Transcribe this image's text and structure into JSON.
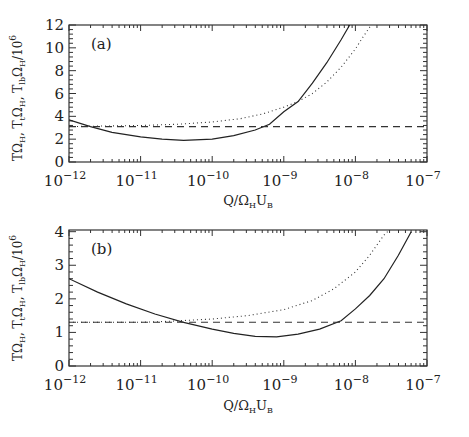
{
  "chart_data": [
    {
      "type": "line",
      "panel_label": "(a)",
      "xscale": "log",
      "xlim_log10": [
        -12,
        -7
      ],
      "ylim": [
        0,
        12
      ],
      "x_tick_labels": [
        {
          "base": "10",
          "exp": "−12"
        },
        {
          "base": "10",
          "exp": "−11"
        },
        {
          "base": "10",
          "exp": "−10"
        },
        {
          "base": "10",
          "exp": "−9"
        },
        {
          "base": "10",
          "exp": "−8"
        },
        {
          "base": "10",
          "exp": "−7"
        }
      ],
      "y_tick_labels": [
        "0",
        "2",
        "4",
        "6",
        "8",
        "10",
        "12"
      ],
      "y_ticks": [
        0,
        2,
        4,
        6,
        8,
        10,
        12
      ],
      "xlabel": {
        "main": "Q/Ω",
        "sub1": "H",
        "mid": "U",
        "sub2": "B"
      },
      "ylabel": "TΩH, TtΩH, TlbΩH/10^6",
      "series": [
        {
          "name": "T Ω_H",
          "style": "solid",
          "log10_x": [
            -12,
            -11.7,
            -11.4,
            -11.0,
            -10.7,
            -10.4,
            -10.0,
            -9.7,
            -9.4,
            -9.2,
            -9.0,
            -8.8,
            -8.6,
            -8.4,
            -8.2,
            -8.08
          ],
          "y": [
            3.7,
            3.1,
            2.6,
            2.2,
            2.0,
            1.9,
            2.0,
            2.3,
            2.8,
            3.3,
            4.4,
            5.3,
            6.9,
            8.7,
            10.7,
            12.0
          ]
        },
        {
          "name": "T_t Ω_H",
          "style": "dotted",
          "log10_x": [
            -12,
            -11.5,
            -11.0,
            -10.5,
            -10.0,
            -9.6,
            -9.3,
            -9.0,
            -8.8,
            -8.6,
            -8.4,
            -8.2,
            -8.0,
            -7.9,
            -7.78
          ],
          "y": [
            3.1,
            3.15,
            3.2,
            3.3,
            3.5,
            3.8,
            4.2,
            4.8,
            5.3,
            6.0,
            7.0,
            8.3,
            9.9,
            10.9,
            12.0
          ]
        },
        {
          "name": "T_lb Ω_H",
          "style": "dashed",
          "log10_x": [
            -12,
            -7
          ],
          "y": [
            3.1,
            3.1
          ]
        }
      ]
    },
    {
      "type": "line",
      "panel_label": "(b)",
      "xscale": "log",
      "xlim_log10": [
        -12,
        -7
      ],
      "ylim": [
        0,
        4.05
      ],
      "x_tick_labels": [
        {
          "base": "10",
          "exp": "−12"
        },
        {
          "base": "10",
          "exp": "−11"
        },
        {
          "base": "10",
          "exp": "−10"
        },
        {
          "base": "10",
          "exp": "−9"
        },
        {
          "base": "10",
          "exp": "−8"
        },
        {
          "base": "10",
          "exp": "−7"
        }
      ],
      "y_tick_labels": [
        "0",
        "1",
        "2",
        "3",
        "4"
      ],
      "y_ticks": [
        0,
        1,
        2,
        3,
        4
      ],
      "xlabel": {
        "main": "Q/Ω",
        "sub1": "H",
        "mid": "U",
        "sub2": "B"
      },
      "ylabel": "TΩH, TtΩH, TlbΩH/10^6",
      "series": [
        {
          "name": "T Ω_H",
          "style": "solid",
          "log10_x": [
            -12,
            -11.6,
            -11.2,
            -10.8,
            -10.4,
            -10.0,
            -9.7,
            -9.4,
            -9.1,
            -8.8,
            -8.5,
            -8.2,
            -8.0,
            -7.8,
            -7.6,
            -7.4,
            -7.22
          ],
          "y": [
            2.6,
            2.2,
            1.85,
            1.55,
            1.3,
            1.1,
            0.97,
            0.88,
            0.87,
            0.95,
            1.1,
            1.35,
            1.7,
            2.1,
            2.6,
            3.3,
            4.0
          ]
        },
        {
          "name": "T_t Ω_H",
          "style": "dotted",
          "log10_x": [
            -12,
            -11.0,
            -10.6,
            -10.0,
            -9.5,
            -9.0,
            -8.6,
            -8.3,
            -8.0,
            -7.8,
            -7.6,
            -7.55
          ],
          "y": [
            1.3,
            1.3,
            1.33,
            1.4,
            1.5,
            1.68,
            1.95,
            2.3,
            2.8,
            3.3,
            3.9,
            4.0
          ]
        },
        {
          "name": "T_lb Ω_H",
          "style": "dashed",
          "log10_x": [
            -12,
            -7
          ],
          "y": [
            1.3,
            1.3
          ]
        }
      ]
    }
  ]
}
